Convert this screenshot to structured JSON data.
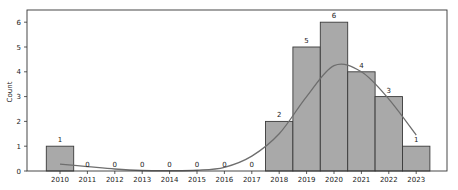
{
  "chart_data": {
    "type": "bar",
    "title": "",
    "xlabel": "",
    "ylabel": "Count",
    "categories": [
      "2010",
      "2011",
      "2012",
      "2013",
      "2014",
      "2015",
      "2016",
      "2017",
      "2018",
      "2019",
      "2020",
      "2021",
      "2022",
      "2023"
    ],
    "values": [
      1,
      0,
      0,
      0,
      0,
      0,
      0,
      0,
      2,
      5,
      6,
      4,
      3,
      1
    ],
    "bar_labels": [
      "1",
      "0",
      "0",
      "0",
      "0",
      "0",
      "0",
      "0",
      "2",
      "5",
      "6",
      "4",
      "3",
      "1"
    ],
    "yticks": [
      0,
      1,
      2,
      3,
      4,
      5,
      6
    ],
    "ylim": [
      0,
      6.0
    ],
    "grid": false,
    "legend": null,
    "overlay": {
      "type": "kde-line",
      "x": [
        2010,
        2011,
        2012,
        2013,
        2014,
        2015,
        2016,
        2017,
        2018,
        2019,
        2020,
        2021,
        2022,
        2023
      ],
      "y": [
        0.28,
        0.18,
        0.08,
        0.02,
        0.01,
        0.03,
        0.15,
        0.6,
        1.5,
        3.0,
        4.25,
        4.0,
        2.9,
        1.45
      ]
    },
    "colors": {
      "bar_fill": "#a9a9a9",
      "bar_edge": "#3a3a3a",
      "line": "#6e6e6e",
      "axes": "#333333"
    }
  }
}
